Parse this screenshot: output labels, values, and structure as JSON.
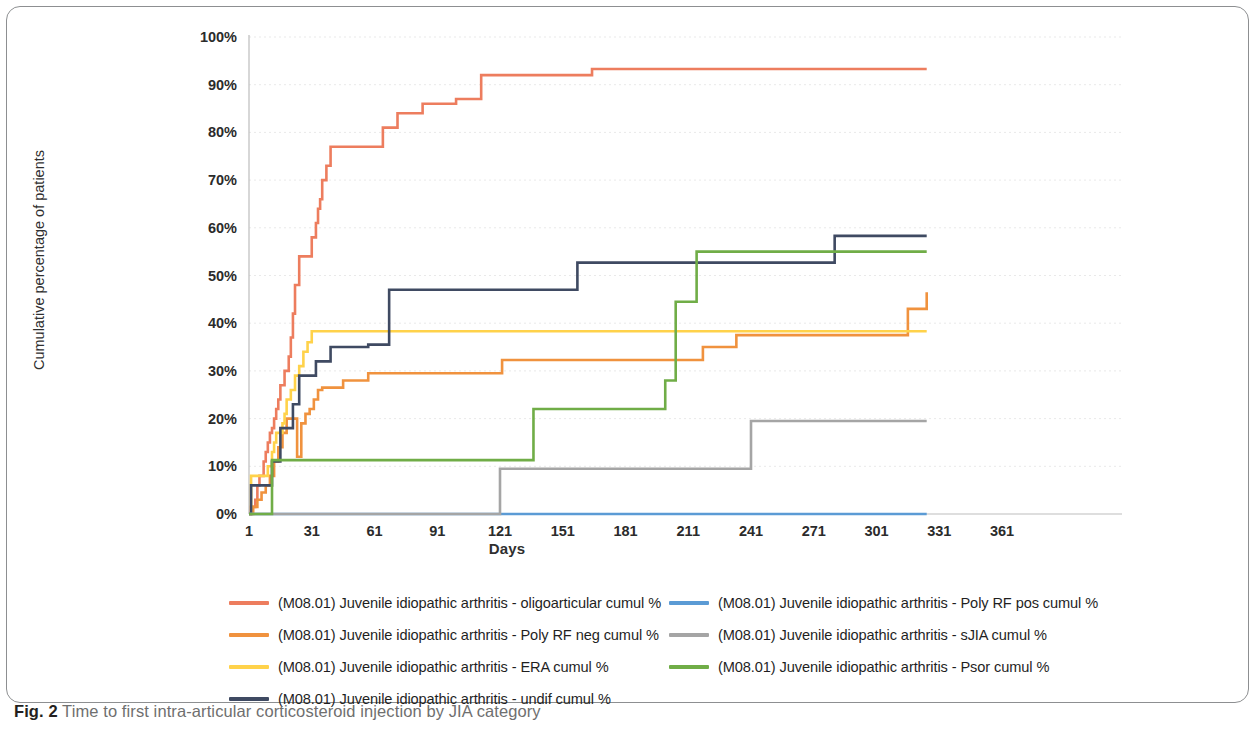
{
  "caption": {
    "figure_number": "Fig. 2",
    "text": " Time to first intra-articular corticosteroid injection by JIA category"
  },
  "chart_data": {
    "type": "line",
    "title": "",
    "xlabel": "Days",
    "ylabel": "Cumulative percentage of patients",
    "xlim": [
      1,
      361
    ],
    "ylim": [
      0,
      100
    ],
    "grid": true,
    "legend_position": "bottom",
    "x_ticks": [
      "1",
      "31",
      "61",
      "91",
      "121",
      "151",
      "181",
      "211",
      "241",
      "271",
      "301",
      "331",
      "361"
    ],
    "y_ticks": [
      "0%",
      "10%",
      "20%",
      "30%",
      "40%",
      "50%",
      "60%",
      "70%",
      "80%",
      "90%",
      "100%"
    ],
    "series": [
      {
        "name": "(M08.01) Juvenile idiopathic arthritis - oligoarticular cumul %",
        "color": "#ED7D5E",
        "points": [
          [
            1,
            0
          ],
          [
            2,
            1.5
          ],
          [
            4,
            3
          ],
          [
            5,
            6
          ],
          [
            6,
            8
          ],
          [
            8,
            11
          ],
          [
            9,
            13
          ],
          [
            10,
            15
          ],
          [
            11,
            17
          ],
          [
            12,
            18
          ],
          [
            13,
            20
          ],
          [
            14,
            22
          ],
          [
            15,
            24
          ],
          [
            16,
            27
          ],
          [
            18,
            30
          ],
          [
            20,
            33
          ],
          [
            21,
            37
          ],
          [
            22,
            42
          ],
          [
            23,
            48
          ],
          [
            25,
            54
          ],
          [
            30,
            54
          ],
          [
            31,
            58
          ],
          [
            33,
            61
          ],
          [
            34,
            64
          ],
          [
            35,
            66
          ],
          [
            36,
            70
          ],
          [
            38,
            73
          ],
          [
            40,
            77
          ],
          [
            63,
            77
          ],
          [
            65,
            81
          ],
          [
            70,
            81
          ],
          [
            72,
            84
          ],
          [
            80,
            84
          ],
          [
            84,
            86
          ],
          [
            95,
            86
          ],
          [
            100,
            87
          ],
          [
            108,
            87
          ],
          [
            112,
            92
          ],
          [
            161,
            92
          ],
          [
            165,
            93.3
          ],
          [
            325,
            93.3
          ]
        ]
      },
      {
        "name": "(M08.01) Juvenile idiopathic arthritis - Poly RF neg cumul %",
        "color": "#F0923E",
        "points": [
          [
            1,
            0
          ],
          [
            3,
            1.5
          ],
          [
            5,
            3
          ],
          [
            7,
            4.5
          ],
          [
            9,
            6
          ],
          [
            11,
            8
          ],
          [
            13,
            11
          ],
          [
            15,
            14
          ],
          [
            17,
            17
          ],
          [
            19,
            20
          ],
          [
            21,
            20
          ],
          [
            24,
            12
          ],
          [
            25,
            12
          ],
          [
            26,
            19
          ],
          [
            28,
            21
          ],
          [
            30,
            22
          ],
          [
            32,
            24
          ],
          [
            34,
            26
          ],
          [
            36,
            26.5
          ],
          [
            44,
            26.5
          ],
          [
            46,
            28
          ],
          [
            55,
            28
          ],
          [
            58,
            29.5
          ],
          [
            118,
            29.5
          ],
          [
            122,
            32.3
          ],
          [
            198,
            32.3
          ],
          [
            203,
            32.3
          ],
          [
            205,
            32.3
          ],
          [
            213,
            32.3
          ],
          [
            218,
            35
          ],
          [
            228,
            35
          ],
          [
            234,
            37.5
          ],
          [
            306,
            37.5
          ],
          [
            316,
            43
          ],
          [
            325,
            46.5
          ]
        ]
      },
      {
        "name": "(M08.01) Juvenile idiopathic arthritis - ERA cumul %",
        "color": "#FFD24A",
        "points": [
          [
            1,
            0
          ],
          [
            2,
            8
          ],
          [
            8,
            8
          ],
          [
            10,
            10
          ],
          [
            12,
            13
          ],
          [
            13,
            15
          ],
          [
            14,
            17
          ],
          [
            16,
            17
          ],
          [
            17,
            19
          ],
          [
            18,
            21
          ],
          [
            19,
            24
          ],
          [
            21,
            26
          ],
          [
            23,
            29
          ],
          [
            25,
            31
          ],
          [
            27,
            34
          ],
          [
            29,
            36
          ],
          [
            31,
            38.3
          ],
          [
            325,
            38.3
          ]
        ]
      },
      {
        "name": "(M08.01) Juvenile idiopathic arthritis - undif cumul %",
        "color": "#3F4A62",
        "points": [
          [
            1,
            0
          ],
          [
            2,
            6
          ],
          [
            10,
            6
          ],
          [
            12,
            11
          ],
          [
            14,
            11
          ],
          [
            16,
            18
          ],
          [
            18,
            18
          ],
          [
            20,
            18
          ],
          [
            22,
            23
          ],
          [
            25,
            29
          ],
          [
            31,
            29
          ],
          [
            33,
            32
          ],
          [
            38,
            32
          ],
          [
            40,
            35
          ],
          [
            55,
            35
          ],
          [
            58,
            35.5
          ],
          [
            66,
            35.5
          ],
          [
            68,
            47
          ],
          [
            95,
            47
          ],
          [
            152,
            47
          ],
          [
            158,
            52.7
          ],
          [
            276,
            52.7
          ],
          [
            281,
            58.3
          ],
          [
            325,
            58.3
          ]
        ]
      },
      {
        "name": "(M08.01) Juvenile idiopathic arthritis - Poly RF pos cumul %",
        "color": "#5B9BD5",
        "points": [
          [
            1,
            0
          ],
          [
            120,
            0
          ],
          [
            325,
            0
          ]
        ]
      },
      {
        "name": "(M08.01) Juvenile idiopathic arthritis - sJIA cumul %",
        "color": "#A5A5A5",
        "points": [
          [
            1,
            0
          ],
          [
            121,
            0
          ],
          [
            121,
            9.5
          ],
          [
            241,
            9.5
          ],
          [
            241,
            19.5
          ],
          [
            325,
            19.5
          ]
        ]
      },
      {
        "name": "(M08.01) Juvenile idiopathic arthritis - Psor cumul %",
        "color": "#70AD47",
        "points": [
          [
            1,
            0
          ],
          [
            12,
            0
          ],
          [
            12,
            11.3
          ],
          [
            137,
            11.3
          ],
          [
            137,
            22
          ],
          [
            200,
            22
          ],
          [
            200,
            28
          ],
          [
            205,
            28
          ],
          [
            205,
            44.5
          ],
          [
            215,
            44.5
          ],
          [
            215,
            55
          ],
          [
            325,
            55
          ]
        ]
      }
    ]
  },
  "legend": {
    "left_column": [
      {
        "label": "(M08.01) Juvenile idiopathic arthritis - oligoarticular cumul %",
        "color": "#ED7D5E"
      },
      {
        "label": "(M08.01) Juvenile idiopathic arthritis - Poly RF neg cumul %",
        "color": "#F0923E"
      },
      {
        "label": "(M08.01) Juvenile idiopathic arthritis - ERA cumul %",
        "color": "#FFD24A"
      },
      {
        "label": "(M08.01) Juvenile idiopathic arthritis - undif cumul %",
        "color": "#3F4A62"
      }
    ],
    "right_column": [
      {
        "label": "(M08.01) Juvenile idiopathic arthritis - Poly RF pos cumul %",
        "color": "#5B9BD5"
      },
      {
        "label": "(M08.01) Juvenile idiopathic arthritis - sJIA cumul %",
        "color": "#A5A5A5"
      },
      {
        "label": "(M08.01) Juvenile idiopathic arthritis - Psor cumul %",
        "color": "#70AD47"
      }
    ]
  }
}
